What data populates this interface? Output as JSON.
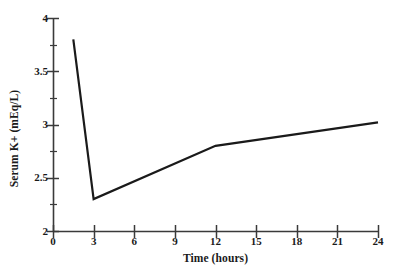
{
  "chart_data": {
    "type": "line",
    "title": "",
    "xlabel": "Time (hours)",
    "ylabel": "Serum K+ (mEq/L)",
    "xlim": [
      0,
      24
    ],
    "ylim": [
      2,
      4
    ],
    "xticks": [
      0,
      3,
      6,
      9,
      12,
      15,
      18,
      21,
      24
    ],
    "xtick_labels": [
      "0",
      "3",
      "6",
      "9",
      "12",
      "15",
      "18",
      "21",
      "24"
    ],
    "yticks": [
      2,
      2.5,
      3,
      3.5,
      4
    ],
    "ytick_labels": [
      "2",
      "2.5",
      "3",
      "3.5",
      "4"
    ],
    "y_minor_ticks": [
      2.25,
      2.75,
      3.25,
      3.75
    ],
    "grid": false,
    "legend": null,
    "series": [
      {
        "name": "Serum K+",
        "color": "#1a1a1a",
        "linewidth": 2.2,
        "x": [
          1.5,
          3,
          12,
          24
        ],
        "y": [
          3.8,
          2.3,
          2.8,
          3.02
        ]
      }
    ],
    "axis_color": "#3a3a3a",
    "background": "#ffffff"
  },
  "axes": {
    "x": {
      "label": "Time (hours)"
    },
    "y": {
      "label": "Serum K+ (mEq/L)"
    }
  }
}
